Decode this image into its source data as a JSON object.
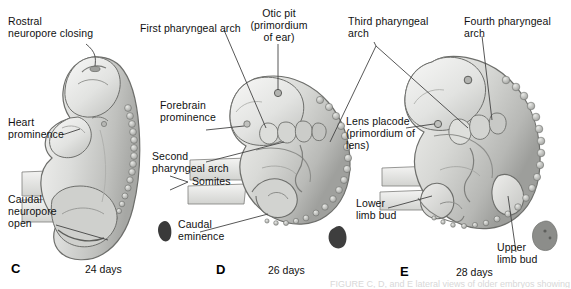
{
  "figure": {
    "background_color": "#ffffff"
  },
  "panels": [
    {
      "letter": "C",
      "days": "24 days",
      "labels": [
        "Rostral\nneuropore closing",
        "Heart\nprominence",
        "Caudal\nneuropore\nopen"
      ]
    },
    {
      "letter": "D",
      "days": "26 days",
      "labels": [
        "First pharyngeal arch",
        "Otic pit\n(primordium\nof ear)",
        "Forebrain\nprominence",
        "Second\npharyngeal arch",
        "Somites",
        "Caudal\neminence"
      ]
    },
    {
      "letter": "E",
      "days": "28 days",
      "labels": [
        "Third pharyngeal\narch",
        "Fourth pharyngeal\narch",
        "Lens placode\n(primordium of\nlens)",
        "Lower\nlimb bud",
        "Upper\nlimb bud"
      ]
    }
  ],
  "annotations": {
    "rostral_neuropore": "Rostral\nneuropore closing",
    "heart_prominence": "Heart\nprominence",
    "caudal_neuropore": "Caudal\nneuropore\nopen",
    "first_pharyngeal_arch": "First pharyngeal arch",
    "otic_pit": "Otic pit\n(primordium\nof ear)",
    "forebrain_prominence": "Forebrain\nprominence",
    "second_pharyngeal_arch": "Second\npharyngeal arch",
    "somites": "Somites",
    "caudal_eminence": "Caudal\neminence",
    "third_pharyngeal_arch": "Third pharyngeal\narch",
    "fourth_pharyngeal_arch": "Fourth pharyngeal\narch",
    "lens_placode": "Lens placode\n(primordium of\nlens)",
    "lower_limb_bud": "Lower\nlimb bud",
    "upper_limb_bud": "Upper\nlimb bud"
  },
  "panel_letters": {
    "c": "C",
    "d": "D",
    "e": "E"
  },
  "panel_days": {
    "c": "24 days",
    "d": "26 days",
    "e": "28 days"
  },
  "colors": {
    "embryo_light": "#e6e6e4",
    "embryo_mid": "#c8c9c6",
    "embryo_dark": "#9fa09d",
    "outline": "#6d6e6b",
    "leader_line": "#444444",
    "actual_size_dark": "#3a3a3a",
    "actual_size_grey": "#8c8d8a"
  },
  "cut_caption": "FIGURE  C, D, and E  lateral views of older embryos showing"
}
